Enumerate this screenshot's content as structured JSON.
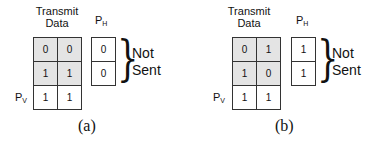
{
  "panels": [
    {
      "caption": "(a)",
      "title_line1": "Transmit",
      "title_line2": "Data",
      "ph_label": "P",
      "ph_sub": "H",
      "pv_label": "P",
      "pv_sub": "V",
      "data": [
        [
          "0",
          "0"
        ],
        [
          "1",
          "1"
        ]
      ],
      "pv": [
        "1",
        "1"
      ],
      "ph": [
        "0",
        "0"
      ],
      "note_line1": "Not",
      "note_line2": "Sent"
    },
    {
      "caption": "(b)",
      "title_line1": "Transmit",
      "title_line2": "Data",
      "ph_label": "P",
      "ph_sub": "H",
      "pv_label": "P",
      "pv_sub": "V",
      "data": [
        [
          "0",
          "1"
        ],
        [
          "1",
          "0"
        ]
      ],
      "pv": [
        "1",
        "1"
      ],
      "ph": [
        "1",
        "1"
      ],
      "note_line1": "Not",
      "note_line2": "Sent"
    }
  ],
  "colors": {
    "shaded_cell": "#e4e4e4",
    "border": "#333333"
  }
}
